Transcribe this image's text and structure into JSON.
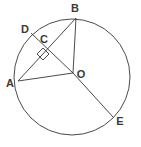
{
  "figure": {
    "background_color": "#ffffff",
    "stroke_color": "#4a4a4a",
    "label_color": "#3a3a3a",
    "stroke_width": 1
  },
  "circle": {
    "name": "circle-outline",
    "cx": 72,
    "cy": 77,
    "r": 58
  },
  "points": [
    {
      "id": "A",
      "label": "A",
      "x": 18,
      "y": 81,
      "label_x": 10,
      "label_y": 84
    },
    {
      "id": "B",
      "label": "B",
      "x": 76,
      "y": 18,
      "label_x": 75,
      "label_y": 9
    },
    {
      "id": "C",
      "label": "C",
      "x": 43,
      "y": 47,
      "label_x": 44,
      "label_y": 40
    },
    {
      "id": "D",
      "label": "D",
      "x": 31,
      "y": 33,
      "label_x": 25,
      "label_y": 30
    },
    {
      "id": "O",
      "label": "O",
      "x": 73,
      "y": 73,
      "label_x": 81,
      "label_y": 75
    },
    {
      "id": "E",
      "label": "E",
      "x": 113,
      "y": 117,
      "label_x": 120,
      "label_y": 122
    }
  ],
  "segments": [
    {
      "name": "segment-AB",
      "from": "A",
      "to": "B",
      "x1": 18,
      "y1": 81,
      "x2": 76,
      "y2": 18
    },
    {
      "name": "segment-AO",
      "from": "A",
      "to": "O",
      "x1": 18,
      "y1": 81,
      "x2": 73,
      "y2": 73
    },
    {
      "name": "segment-BO",
      "from": "B",
      "to": "O",
      "x1": 76,
      "y1": 18,
      "x2": 73,
      "y2": 73
    },
    {
      "name": "segment-DO",
      "from": "D",
      "to": "O",
      "x1": 31,
      "y1": 33,
      "x2": 73,
      "y2": 73
    },
    {
      "name": "segment-OE",
      "from": "O",
      "to": "E",
      "x1": 73,
      "y1": 73,
      "x2": 113,
      "y2": 117
    }
  ],
  "right_angle_mark": {
    "name": "right-angle-mark-at-C",
    "at_point": "C",
    "points": "43,48 49,54 43,60 37,54"
  }
}
